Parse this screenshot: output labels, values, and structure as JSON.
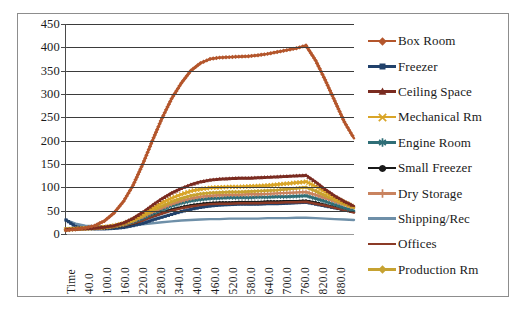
{
  "chart_data": {
    "type": "line",
    "title": "",
    "subtitle": "",
    "xlabel": "",
    "ylabel": "",
    "grid": true,
    "legend_position": "right",
    "ylim": [
      0,
      450
    ],
    "ytick_values": [
      450,
      400,
      350,
      300,
      250,
      200,
      150,
      100,
      50,
      0
    ],
    "ytick_labels": [
      "450",
      "400",
      "350",
      "300",
      "250",
      "200",
      "150",
      "100",
      "50",
      "0"
    ],
    "x_axis_first_label": "Time",
    "xtick_labels": [
      "Time",
      "40.0",
      "100.0",
      "160.0",
      "220.0",
      "280.0",
      "340.0",
      "400.0",
      "460.0",
      "520.0",
      "580.0",
      "640.0",
      "700.0",
      "760.0",
      "820.0",
      "880.0"
    ],
    "x": [
      10,
      40,
      70,
      100,
      130,
      160,
      190,
      220,
      250,
      280,
      310,
      340,
      370,
      400,
      430,
      460,
      490,
      520,
      550,
      580,
      610,
      640,
      670,
      700,
      730,
      760,
      790,
      820,
      850,
      880,
      910
    ],
    "xlim": [
      10,
      910
    ],
    "series": [
      {
        "name": "Box Room",
        "color": "#B4562C",
        "marker": "diamond",
        "values": [
          8,
          10,
          13,
          18,
          28,
          45,
          70,
          105,
          150,
          200,
          248,
          290,
          323,
          350,
          366,
          375,
          378,
          379,
          380,
          381,
          383,
          386,
          390,
          394,
          398,
          404,
          372,
          330,
          285,
          240,
          205
        ]
      },
      {
        "name": "Freezer",
        "color": "#21416B",
        "marker": "square",
        "values": [
          30,
          16,
          12,
          11,
          11,
          12,
          14,
          18,
          23,
          30,
          36,
          42,
          48,
          53,
          57,
          60,
          62,
          63,
          64,
          64,
          64,
          65,
          65,
          66,
          67,
          68,
          64,
          60,
          56,
          52,
          48
        ]
      },
      {
        "name": "Ceiling Space",
        "color": "#7A2B20",
        "marker": "triangle",
        "values": [
          10,
          11,
          12,
          13,
          15,
          18,
          24,
          34,
          47,
          62,
          76,
          88,
          98,
          106,
          112,
          116,
          118,
          119,
          120,
          120,
          121,
          122,
          123,
          124,
          125,
          126,
          112,
          96,
          82,
          70,
          60
        ]
      },
      {
        "name": "Mechanical Rm",
        "color": "#D9A528",
        "marker": "x",
        "values": [
          10,
          11,
          12,
          13,
          15,
          18,
          23,
          31,
          42,
          55,
          67,
          77,
          85,
          92,
          96,
          99,
          100,
          101,
          101,
          102,
          103,
          104,
          106,
          108,
          110,
          112,
          102,
          90,
          78,
          68,
          58
        ]
      },
      {
        "name": "Engine Room",
        "color": "#2F6E77",
        "marker": "asterisk",
        "values": [
          10,
          11,
          12,
          13,
          14,
          16,
          20,
          26,
          34,
          43,
          52,
          60,
          66,
          71,
          74,
          76,
          77,
          78,
          78,
          78,
          79,
          79,
          80,
          80,
          81,
          82,
          76,
          70,
          63,
          56,
          50
        ]
      },
      {
        "name": "Small Freezer",
        "color": "#1a1a1a",
        "marker": "circle",
        "values": [
          10,
          11,
          11,
          12,
          13,
          15,
          18,
          23,
          30,
          38,
          45,
          52,
          57,
          61,
          64,
          66,
          67,
          67,
          68,
          68,
          68,
          69,
          69,
          70,
          70,
          71,
          67,
          62,
          57,
          52,
          47
        ]
      },
      {
        "name": "Dry Storage",
        "color": "#C9835F",
        "marker": "plus",
        "values": [
          10,
          11,
          12,
          13,
          14,
          17,
          21,
          28,
          37,
          47,
          56,
          64,
          71,
          76,
          80,
          82,
          83,
          84,
          84,
          85,
          85,
          86,
          87,
          88,
          89,
          90,
          84,
          77,
          70,
          63,
          56
        ]
      },
      {
        "name": "Shipping/Rec",
        "color": "#6E8FA8",
        "marker": "line",
        "values": [
          30,
          22,
          18,
          17,
          17,
          17,
          18,
          19,
          21,
          23,
          25,
          27,
          29,
          30,
          31,
          32,
          32,
          33,
          33,
          33,
          33,
          34,
          34,
          34,
          35,
          35,
          34,
          33,
          32,
          31,
          30
        ]
      },
      {
        "name": "Offices",
        "color": "#8B3A26",
        "marker": "line",
        "values": [
          10,
          11,
          11,
          12,
          13,
          15,
          18,
          23,
          29,
          37,
          44,
          50,
          55,
          59,
          62,
          64,
          65,
          65,
          66,
          66,
          66,
          67,
          67,
          68,
          68,
          69,
          65,
          61,
          56,
          51,
          46
        ]
      },
      {
        "name": "Production Rm",
        "color": "#C6A231",
        "marker": "diamond",
        "values": [
          10,
          11,
          12,
          13,
          14,
          17,
          22,
          29,
          39,
          50,
          60,
          69,
          76,
          82,
          86,
          88,
          89,
          90,
          90,
          91,
          92,
          93,
          94,
          96,
          98,
          100,
          92,
          82,
          73,
          64,
          56
        ]
      }
    ]
  }
}
